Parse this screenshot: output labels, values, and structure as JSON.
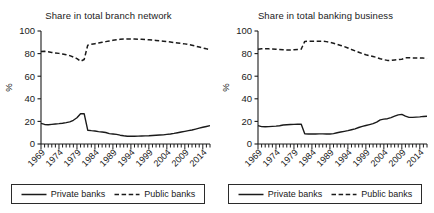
{
  "figure": {
    "background_color": "#ffffff",
    "line_color": "#1a1a1a",
    "panel_count": 2
  },
  "panels": [
    {
      "key": "branch_network",
      "title": "Share in total branch network",
      "legend": {
        "private_label": "Private banks",
        "public_label": "Public banks",
        "private_style": "solid",
        "public_style": "dashed"
      }
    },
    {
      "key": "banking_business",
      "title": "Share in total banking business",
      "legend": {
        "private_label": "Private banks",
        "public_label": "Public banks",
        "private_style": "solid",
        "public_style": "dashed"
      }
    }
  ],
  "chart_data": [
    {
      "type": "line",
      "title": "Share in total branch network",
      "xlabel": "",
      "ylabel": "%",
      "ylim": [
        0,
        100
      ],
      "yticks": [
        0,
        20,
        40,
        60,
        80,
        100
      ],
      "xlim": [
        1969,
        2016
      ],
      "xticks": [
        1969,
        1974,
        1979,
        1984,
        1989,
        1994,
        1999,
        2004,
        2009,
        2014
      ],
      "xtick_labels": [
        "1969",
        "1974",
        "1979",
        "1984",
        "1989",
        "1994",
        "1999",
        "2004",
        "2009",
        "2014"
      ],
      "minor_xtick_interval": 1,
      "grid": false,
      "legend_position": "below",
      "x": [
        1969,
        1970,
        1971,
        1972,
        1973,
        1974,
        1975,
        1976,
        1977,
        1978,
        1979,
        1980,
        1981,
        1982,
        1983,
        1984,
        1985,
        1986,
        1987,
        1988,
        1989,
        1990,
        1991,
        1992,
        1993,
        1994,
        1995,
        1996,
        1997,
        1998,
        1999,
        2000,
        2001,
        2002,
        2003,
        2004,
        2005,
        2006,
        2007,
        2008,
        2009,
        2010,
        2011,
        2012,
        2013,
        2014,
        2015,
        2016
      ],
      "series": [
        {
          "name": "Private banks",
          "style": "solid",
          "values": [
            18.2,
            17.3,
            17.1,
            17.4,
            17.7,
            18.0,
            18.4,
            18.9,
            19.6,
            21.0,
            23.2,
            26.8,
            26.9,
            12.2,
            11.8,
            11.5,
            11.0,
            10.6,
            10.2,
            9.2,
            8.9,
            8.5,
            7.8,
            7.3,
            6.9,
            6.8,
            6.9,
            7.0,
            7.1,
            7.2,
            7.3,
            7.5,
            7.7,
            7.9,
            8.1,
            8.5,
            8.9,
            9.4,
            10.0,
            10.6,
            11.2,
            11.8,
            12.4,
            13.2,
            14.0,
            14.8,
            15.5,
            16.2
          ]
        },
        {
          "name": "Public banks",
          "style": "dashed",
          "values": [
            81.8,
            82.0,
            81.6,
            81.0,
            80.6,
            80.2,
            79.6,
            79.0,
            78.2,
            77.0,
            75.6,
            73.2,
            74.8,
            87.5,
            88.2,
            88.8,
            89.4,
            90.0,
            90.6,
            91.2,
            91.8,
            92.2,
            92.6,
            92.9,
            93.0,
            93.0,
            92.9,
            92.8,
            92.6,
            92.4,
            92.2,
            92.0,
            91.7,
            91.4,
            91.0,
            90.6,
            90.2,
            89.8,
            89.4,
            89.0,
            88.6,
            88.0,
            87.4,
            86.6,
            85.8,
            85.0,
            84.2,
            83.6
          ]
        }
      ]
    },
    {
      "type": "line",
      "title": "Share in total banking business",
      "xlabel": "",
      "ylabel": "%",
      "ylim": [
        0,
        100
      ],
      "yticks": [
        0,
        20,
        40,
        60,
        80,
        100
      ],
      "xlim": [
        1969,
        2016
      ],
      "xticks": [
        1969,
        1974,
        1979,
        1984,
        1989,
        1994,
        1999,
        2004,
        2009,
        2014
      ],
      "xtick_labels": [
        "1969",
        "1974",
        "1979",
        "1984",
        "1989",
        "1994",
        "1999",
        "2004",
        "2009",
        "2014"
      ],
      "minor_xtick_interval": 1,
      "grid": false,
      "legend_position": "below",
      "x": [
        1969,
        1970,
        1971,
        1972,
        1973,
        1974,
        1975,
        1976,
        1977,
        1978,
        1979,
        1980,
        1981,
        1982,
        1983,
        1984,
        1985,
        1986,
        1987,
        1988,
        1989,
        1990,
        1991,
        1992,
        1993,
        1994,
        1995,
        1996,
        1997,
        1998,
        1999,
        2000,
        2001,
        2002,
        2003,
        2004,
        2005,
        2006,
        2007,
        2008,
        2009,
        2010,
        2011,
        2012,
        2013,
        2014,
        2015,
        2016
      ],
      "series": [
        {
          "name": "Private banks",
          "style": "solid",
          "values": [
            16.2,
            15.4,
            15.2,
            15.4,
            15.6,
            15.8,
            16.2,
            16.8,
            17.0,
            17.2,
            17.4,
            17.5,
            17.6,
            9.0,
            8.8,
            8.8,
            8.9,
            9.0,
            9.0,
            8.9,
            8.8,
            9.2,
            10.0,
            10.6,
            11.2,
            11.8,
            12.6,
            13.4,
            14.6,
            15.6,
            16.4,
            17.2,
            18.0,
            19.4,
            21.4,
            22.0,
            22.4,
            23.4,
            24.6,
            25.8,
            26.2,
            24.6,
            23.6,
            23.6,
            23.8,
            24.0,
            24.4,
            24.6
          ]
        },
        {
          "name": "Public banks",
          "style": "dashed",
          "values": [
            83.8,
            84.2,
            84.4,
            84.2,
            84.0,
            83.8,
            83.6,
            83.4,
            83.2,
            83.2,
            83.4,
            83.6,
            83.8,
            90.8,
            91.0,
            91.0,
            91.0,
            91.0,
            91.0,
            90.6,
            90.0,
            89.2,
            88.2,
            87.2,
            86.2,
            85.0,
            83.6,
            82.4,
            81.2,
            80.0,
            79.0,
            78.2,
            77.4,
            76.6,
            75.4,
            74.6,
            74.0,
            74.0,
            74.4,
            74.6,
            75.0,
            76.2,
            76.4,
            76.2,
            76.2,
            76.2,
            76.0,
            75.4
          ]
        }
      ]
    }
  ]
}
